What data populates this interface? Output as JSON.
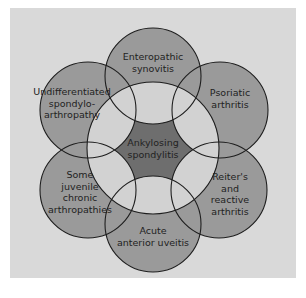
{
  "diagram": {
    "center": {
      "lines": [
        "Ankylosing",
        "spondylitis"
      ]
    },
    "outer": [
      {
        "id": "enteropathic",
        "lines": [
          "Enteropathic",
          "synovitis"
        ]
      },
      {
        "id": "psoriatic",
        "lines": [
          "Psoriatic",
          "arthritis"
        ]
      },
      {
        "id": "reiters",
        "lines": [
          "Reiter's",
          "and",
          "reactive",
          "arthritis"
        ]
      },
      {
        "id": "uveitis",
        "lines": [
          "Acute",
          "anterior uveitis"
        ]
      },
      {
        "id": "juvenile",
        "lines": [
          "Some",
          "juvenile",
          "chronic",
          "arthropathies"
        ]
      },
      {
        "id": "undifferentiated",
        "lines": [
          "Undifferentiated",
          "spondylo-",
          "arthropathy"
        ]
      }
    ]
  }
}
